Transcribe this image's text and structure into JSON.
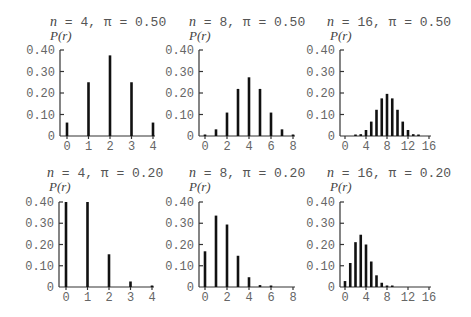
{
  "chart_data": [
    {
      "type": "bar",
      "title": "n = 4, π = 0.50",
      "n": 4,
      "pi": "0.50",
      "ylabel": "P(r)",
      "xlabel": "",
      "x": [
        0,
        1,
        2,
        3,
        4
      ],
      "values": [
        0.0625,
        0.25,
        0.375,
        0.25,
        0.0625
      ],
      "xticks": [
        "0",
        "1",
        "2",
        "3",
        "4"
      ],
      "yticks": [
        "0",
        "0.10",
        "0.20",
        "0.30",
        "0.40"
      ],
      "ylim": [
        0,
        0.4
      ],
      "xlim": [
        0,
        4
      ],
      "grid": false
    },
    {
      "type": "bar",
      "title": "n = 8, π = 0.50",
      "n": 8,
      "pi": "0.50",
      "ylabel": "P(r)",
      "xlabel": "",
      "x": [
        0,
        1,
        2,
        3,
        4,
        5,
        6,
        7,
        8
      ],
      "values": [
        0.004,
        0.031,
        0.109,
        0.219,
        0.273,
        0.219,
        0.109,
        0.031,
        0.004
      ],
      "xticks": [
        "0",
        "2",
        "4",
        "6",
        "8"
      ],
      "yticks": [
        "0",
        "0.10",
        "0.20",
        "0.30",
        "0.40"
      ],
      "ylim": [
        0,
        0.4
      ],
      "xlim": [
        0,
        8
      ],
      "grid": false
    },
    {
      "type": "bar",
      "title": "n = 16, π = 0.50",
      "n": 16,
      "pi": "0.50",
      "ylabel": "P(r)",
      "xlabel": "",
      "x": [
        0,
        1,
        2,
        3,
        4,
        5,
        6,
        7,
        8,
        9,
        10,
        11,
        12,
        13,
        14,
        15,
        16
      ],
      "values": [
        0.0,
        0.0002,
        0.0018,
        0.0085,
        0.028,
        0.067,
        0.122,
        0.175,
        0.196,
        0.175,
        0.122,
        0.067,
        0.028,
        0.0085,
        0.0018,
        0.0002,
        0.0
      ],
      "xticks": [
        "0",
        "4",
        "8",
        "12",
        "16"
      ],
      "yticks": [
        "0",
        "0.10",
        "0.20",
        "0.30",
        "0.40"
      ],
      "ylim": [
        0,
        0.4
      ],
      "xlim": [
        0,
        16
      ],
      "grid": false
    },
    {
      "type": "bar",
      "title": "n = 4, π = 0.20",
      "n": 4,
      "pi": "0.20",
      "ylabel": "P(r)",
      "xlabel": "",
      "x": [
        0,
        1,
        2,
        3,
        4
      ],
      "values": [
        0.41,
        0.41,
        0.154,
        0.026,
        0.002
      ],
      "xticks": [
        "0",
        "1",
        "2",
        "3",
        "4"
      ],
      "yticks": [
        "0",
        "0.10",
        "0.20",
        "0.30",
        "0.40"
      ],
      "ylim": [
        0,
        0.4
      ],
      "xlim": [
        0,
        4
      ],
      "grid": false
    },
    {
      "type": "bar",
      "title": "n = 8, π = 0.20",
      "n": 8,
      "pi": "0.20",
      "ylabel": "P(r)",
      "xlabel": "",
      "x": [
        0,
        1,
        2,
        3,
        4,
        5,
        6,
        7,
        8
      ],
      "values": [
        0.168,
        0.336,
        0.294,
        0.147,
        0.046,
        0.009,
        0.001,
        0.0001,
        0.0
      ],
      "xticks": [
        "0",
        "2",
        "4",
        "6",
        "8"
      ],
      "yticks": [
        "0",
        "0.10",
        "0.20",
        "0.30",
        "0.40"
      ],
      "ylim": [
        0,
        0.4
      ],
      "xlim": [
        0,
        8
      ],
      "grid": false
    },
    {
      "type": "bar",
      "title": "n = 16, π = 0.20",
      "n": 16,
      "pi": "0.20",
      "ylabel": "P(r)",
      "xlabel": "",
      "x": [
        0,
        1,
        2,
        3,
        4,
        5,
        6,
        7,
        8,
        9,
        10,
        11,
        12,
        13,
        14,
        15,
        16
      ],
      "values": [
        0.028,
        0.113,
        0.211,
        0.246,
        0.2,
        0.12,
        0.055,
        0.02,
        0.006,
        0.0013,
        0.0002,
        0,
        0,
        0,
        0,
        0,
        0
      ],
      "xticks": [
        "0",
        "4",
        "8",
        "12",
        "16"
      ],
      "yticks": [
        "0",
        "0.10",
        "0.20",
        "0.30",
        "0.40"
      ],
      "ylim": [
        0,
        0.4
      ],
      "xlim": [
        0,
        16
      ],
      "grid": false
    }
  ]
}
